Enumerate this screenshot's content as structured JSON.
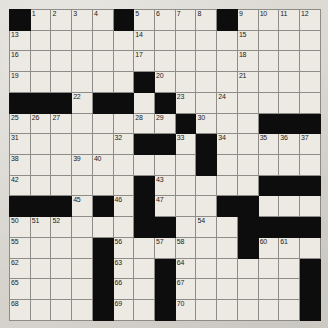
{
  "puzzle": {
    "title": "Crossword Grid",
    "rows": 15,
    "cols": 15,
    "colors": {
      "block": "#0d0d0d",
      "cell": "#eceae3",
      "grid_line": "#8d8c88",
      "border": "#4a4a48",
      "page_background": "#d9d7d0",
      "number_text": "#1b1b1b"
    },
    "legend": {
      "block_symbol": "#",
      "open_symbol": "."
    },
    "layout": [
      "#....#....#....",
      "...............",
      "...............",
      "......#........",
      "###.##.#.......",
      "........#...###",
      "......##.#.....",
      ".........#.....",
      "......#.....###",
      "###.#.#...##...",
      "......##...####",
      "....#......#...",
      "....#..#......#",
      "....#..#......#",
      "....#..#......#"
    ],
    "numbers": [
      {
        "row": 0,
        "col": 1,
        "n": 1
      },
      {
        "row": 0,
        "col": 2,
        "n": 2
      },
      {
        "row": 0,
        "col": 3,
        "n": 3
      },
      {
        "row": 0,
        "col": 4,
        "n": 4
      },
      {
        "row": 0,
        "col": 6,
        "n": 5
      },
      {
        "row": 0,
        "col": 7,
        "n": 6
      },
      {
        "row": 0,
        "col": 8,
        "n": 7
      },
      {
        "row": 0,
        "col": 9,
        "n": 8
      },
      {
        "row": 0,
        "col": 11,
        "n": 9
      },
      {
        "row": 0,
        "col": 12,
        "n": 10
      },
      {
        "row": 0,
        "col": 13,
        "n": 11
      },
      {
        "row": 0,
        "col": 14,
        "n": 12
      },
      {
        "row": 1,
        "col": 0,
        "n": 13
      },
      {
        "row": 1,
        "col": 6,
        "n": 14
      },
      {
        "row": 1,
        "col": 11,
        "n": 15
      },
      {
        "row": 2,
        "col": 0,
        "n": 16
      },
      {
        "row": 2,
        "col": 6,
        "n": 17
      },
      {
        "row": 2,
        "col": 11,
        "n": 18
      },
      {
        "row": 3,
        "col": 0,
        "n": 19
      },
      {
        "row": 3,
        "col": 7,
        "n": 20
      },
      {
        "row": 3,
        "col": 11,
        "n": 21
      },
      {
        "row": 4,
        "col": 3,
        "n": 22
      },
      {
        "row": 4,
        "col": 8,
        "n": 23
      },
      {
        "row": 4,
        "col": 10,
        "n": 24
      },
      {
        "row": 5,
        "col": 0,
        "n": 25
      },
      {
        "row": 5,
        "col": 1,
        "n": 26
      },
      {
        "row": 5,
        "col": 2,
        "n": 27
      },
      {
        "row": 5,
        "col": 6,
        "n": 28
      },
      {
        "row": 5,
        "col": 7,
        "n": 29
      },
      {
        "row": 5,
        "col": 9,
        "n": 30
      },
      {
        "row": 6,
        "col": 0,
        "n": 31
      },
      {
        "row": 6,
        "col": 5,
        "n": 32
      },
      {
        "row": 6,
        "col": 8,
        "n": 33
      },
      {
        "row": 6,
        "col": 10,
        "n": 34
      },
      {
        "row": 6,
        "col": 12,
        "n": 35
      },
      {
        "row": 6,
        "col": 13,
        "n": 36
      },
      {
        "row": 6,
        "col": 14,
        "n": 37
      },
      {
        "row": 7,
        "col": 0,
        "n": 38
      },
      {
        "row": 7,
        "col": 3,
        "n": 39
      },
      {
        "row": 7,
        "col": 4,
        "n": 40
      },
      {
        "row": 7,
        "col": 9,
        "n": 41
      },
      {
        "row": 8,
        "col": 0,
        "n": 42
      },
      {
        "row": 8,
        "col": 7,
        "n": 43
      },
      {
        "row": 8,
        "col": 12,
        "n": 44
      },
      {
        "row": 9,
        "col": 3,
        "n": 45
      },
      {
        "row": 9,
        "col": 5,
        "n": 46
      },
      {
        "row": 9,
        "col": 7,
        "n": 47
      },
      {
        "row": 9,
        "col": 10,
        "n": 48
      },
      {
        "row": 9,
        "col": 11,
        "n": 49
      },
      {
        "row": 10,
        "col": 0,
        "n": 50
      },
      {
        "row": 10,
        "col": 1,
        "n": 51
      },
      {
        "row": 10,
        "col": 2,
        "n": 52
      },
      {
        "row": 10,
        "col": 6,
        "n": 53
      },
      {
        "row": 10,
        "col": 9,
        "n": 54
      },
      {
        "row": 11,
        "col": 0,
        "n": 55
      },
      {
        "row": 11,
        "col": 5,
        "n": 56
      },
      {
        "row": 11,
        "col": 7,
        "n": 57
      },
      {
        "row": 11,
        "col": 8,
        "n": 58
      },
      {
        "row": 11,
        "col": 11,
        "n": 59
      },
      {
        "row": 11,
        "col": 12,
        "n": 60
      },
      {
        "row": 11,
        "col": 13,
        "n": 61
      },
      {
        "row": 12,
        "col": 0,
        "n": 62
      },
      {
        "row": 12,
        "col": 5,
        "n": 63
      },
      {
        "row": 12,
        "col": 8,
        "n": 64
      },
      {
        "row": 13,
        "col": 0,
        "n": 65
      },
      {
        "row": 13,
        "col": 5,
        "n": 66
      },
      {
        "row": 13,
        "col": 8,
        "n": 67
      },
      {
        "row": 14,
        "col": 0,
        "n": 68
      },
      {
        "row": 14,
        "col": 5,
        "n": 69
      },
      {
        "row": 14,
        "col": 8,
        "n": 70
      }
    ],
    "entries": []
  }
}
